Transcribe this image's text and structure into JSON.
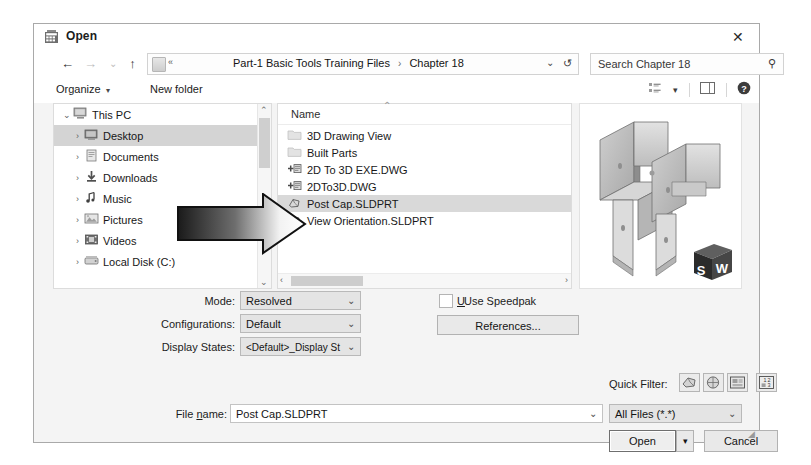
{
  "dialog": {
    "title": "Open",
    "title_icon": "solidworks-open-icon",
    "close_label": "✕"
  },
  "nav": {
    "back_icon": "←",
    "forward_icon": "→",
    "history_icon": "⌄",
    "up_icon": "↑",
    "address_prefix": "«",
    "breadcrumbs": [
      "Part-1 Basic Tools Training Files",
      "Chapter 18"
    ],
    "separator": "›",
    "dropdown_icon": "⌄",
    "refresh_icon": "↺",
    "search_value": "Search Chapter 18",
    "search_icon": "⚲"
  },
  "commandbar": {
    "organize_label": "Organize",
    "organize_caret": "▾",
    "new_folder_label": "New folder",
    "view_icon": "view-list-icon",
    "view_caret": "▾",
    "pane_icon": "preview-pane-icon",
    "help_icon": "?"
  },
  "tree": {
    "items": [
      {
        "label": "This PC",
        "expander": "⌄",
        "icon": "this-pc-icon",
        "level": 0,
        "selected": false
      },
      {
        "label": "Desktop",
        "expander": "›",
        "icon": "desktop-icon",
        "level": 1,
        "selected": true
      },
      {
        "label": "Documents",
        "expander": "›",
        "icon": "documents-icon",
        "level": 1,
        "selected": false
      },
      {
        "label": "Downloads",
        "expander": "›",
        "icon": "downloads-icon",
        "level": 1,
        "selected": false
      },
      {
        "label": "Music",
        "expander": "›",
        "icon": "music-icon",
        "level": 1,
        "selected": false
      },
      {
        "label": "Pictures",
        "expander": "›",
        "icon": "pictures-icon",
        "level": 1,
        "selected": false
      },
      {
        "label": "Videos",
        "expander": "›",
        "icon": "videos-icon",
        "level": 1,
        "selected": false
      },
      {
        "label": "Local Disk (C:)",
        "expander": "›",
        "icon": "local-disk-icon",
        "level": 1,
        "selected": false
      }
    ],
    "scroll_up": "⌃",
    "scroll_down": "⌄"
  },
  "filelist": {
    "column_header": "Name",
    "sort_indicator": "⌃",
    "rows": [
      {
        "name": "3D Drawing View",
        "icon": "folder-icon",
        "selected": false
      },
      {
        "name": "Built Parts",
        "icon": "folder-icon",
        "selected": false
      },
      {
        "name": "2D To 3D EXE.DWG",
        "icon": "dwg-icon",
        "selected": false
      },
      {
        "name": "2DTo3D.DWG",
        "icon": "dwg-icon",
        "selected": false
      },
      {
        "name": "Post Cap.SLDPRT",
        "icon": "sldprt-icon",
        "selected": true
      },
      {
        "name": "View Orientation.SLDPRT",
        "icon": "sldprt-icon",
        "selected": false
      }
    ],
    "hscroll_left": "‹",
    "hscroll_right": "›"
  },
  "preview": {
    "model_name": "post-cap-3d-model",
    "logo_text_left": "S",
    "logo_text_right": "W"
  },
  "options": {
    "mode_label": "Mode:",
    "mode_value": "Resolved",
    "configurations_label": "Configurations:",
    "configurations_value": "Default",
    "display_states_label": "Display States:",
    "display_states_value": "<Default>_Display St",
    "speedpak_label": "Use Speedpak",
    "speedpak_checked": false,
    "references_label": "References...",
    "combo_caret": "⌄"
  },
  "quickfilter": {
    "label": "Quick Filter:",
    "buttons": [
      {
        "icon": "filter-parts-icon"
      },
      {
        "icon": "filter-assemblies-icon"
      },
      {
        "icon": "filter-drawings-icon"
      },
      {
        "icon": "filter-top-level-icon"
      }
    ]
  },
  "footer": {
    "filename_label": "File name:",
    "filename_label_pre": "File ",
    "filename_label_mnemonic": "n",
    "filename_label_post": "ame:",
    "filename_value": "Post Cap.SLDPRT",
    "filetype_value": "All Files (*.*)",
    "combo_caret": "⌄",
    "open_label": "Open",
    "open_split_caret": "▾",
    "cancel_label": "Cancel"
  },
  "annotation": {
    "arrow_name": "pointer-arrow-annotation",
    "points_to": "Post Cap.SLDPRT"
  },
  "colors": {
    "dialog_bg": "#f4f4f4",
    "panel_bg": "#ffffff",
    "selection": "#d4d4d4",
    "border": "#a9a9a9",
    "text": "#1a1a1a"
  }
}
